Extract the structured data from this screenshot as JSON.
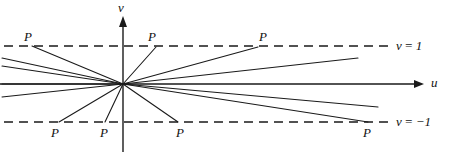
{
  "figure": {
    "background_color": "#ffffff",
    "line_color": "#1a1a1a",
    "width": 450,
    "height": 158
  },
  "axes": {
    "origin": {
      "x": 123,
      "y": 84
    },
    "horizontal": {
      "label": "u",
      "label_x": 431,
      "label_y": 78,
      "x1": 0,
      "y1": 84,
      "x2": 424,
      "y2": 84
    },
    "vertical": {
      "label": "v",
      "label_x": 118,
      "label_y": 2,
      "x1": 123,
      "y1": 152,
      "x2": 123,
      "y2": 17
    }
  },
  "level_lines": [
    {
      "name": "v-equals-one",
      "label": "v = 1",
      "label_x": 396,
      "label_y": 39,
      "y": 46,
      "x1": 4,
      "x2": 392
    },
    {
      "name": "v-equals-minus-one",
      "label": "v = −1",
      "label_x": 396,
      "label_y": 116,
      "y": 122,
      "x1": 4,
      "x2": 392
    }
  ],
  "rays": [
    {
      "name": "ray-upper-left-steep",
      "x1": 123,
      "y1": 84,
      "x2": 32,
      "y2": 46
    },
    {
      "name": "ray-upper-left-shallow-a",
      "x1": 123,
      "y1": 84,
      "x2": 2,
      "y2": 58
    },
    {
      "name": "ray-upper-left-shallow-b",
      "x1": 123,
      "y1": 84,
      "x2": 2,
      "y2": 66
    },
    {
      "name": "ray-horizontal-left",
      "x1": 123,
      "y1": 84,
      "x2": 2,
      "y2": 84
    },
    {
      "name": "ray-lower-left-shallow",
      "x1": 123,
      "y1": 84,
      "x2": 2,
      "y2": 97
    },
    {
      "name": "ray-lower-left-steep",
      "x1": 123,
      "y1": 84,
      "x2": 59,
      "y2": 122
    },
    {
      "name": "ray-down-near-vertical",
      "x1": 123,
      "y1": 84,
      "x2": 105,
      "y2": 122
    },
    {
      "name": "ray-down-right-steep",
      "x1": 123,
      "y1": 84,
      "x2": 178,
      "y2": 122
    },
    {
      "name": "ray-up-right-steep",
      "x1": 123,
      "y1": 84,
      "x2": 156,
      "y2": 47
    },
    {
      "name": "ray-up-right-medium",
      "x1": 123,
      "y1": 84,
      "x2": 258,
      "y2": 47
    },
    {
      "name": "ray-up-right-shallow",
      "x1": 123,
      "y1": 84,
      "x2": 358,
      "y2": 58
    },
    {
      "name": "ray-horizontal-right",
      "x1": 123,
      "y1": 84,
      "x2": 424,
      "y2": 84
    },
    {
      "name": "ray-down-right-shallow",
      "x1": 123,
      "y1": 84,
      "x2": 378,
      "y2": 107
    },
    {
      "name": "ray-down-right-medium",
      "x1": 123,
      "y1": 84,
      "x2": 368,
      "y2": 122
    }
  ],
  "p_labels": [
    {
      "name": "p-top-left",
      "text": "P",
      "x": 24,
      "y": 30
    },
    {
      "name": "p-top-mid",
      "text": "P",
      "x": 148,
      "y": 30
    },
    {
      "name": "p-top-right",
      "text": "P",
      "x": 259,
      "y": 30
    },
    {
      "name": "p-bottom-left",
      "text": "P",
      "x": 51,
      "y": 126
    },
    {
      "name": "p-bottom-mid",
      "text": "P",
      "x": 100,
      "y": 126
    },
    {
      "name": "p-bottom-right",
      "text": "P",
      "x": 176,
      "y": 126
    },
    {
      "name": "p-bottom-far-right",
      "text": "P",
      "x": 363,
      "y": 126
    }
  ]
}
